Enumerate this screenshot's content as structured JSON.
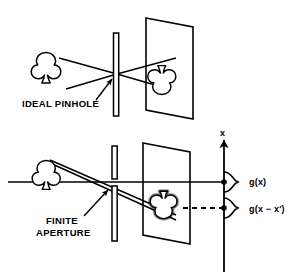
{
  "figure": {
    "title_visible": false,
    "background_color": "#ffffff",
    "ink_color": "#000000",
    "width": 300,
    "height": 279
  },
  "panels": [
    {
      "id": "ideal-pinhole",
      "caption": "IDEAL PINHOLE",
      "object_icon": "club-suit-icon",
      "barrier": "pinhole-barrier",
      "screen": "projection-screen",
      "image_icon": "club-suit-inverted-icon",
      "image_sharpness": "sharp"
    },
    {
      "id": "finite-aperture",
      "caption_line1": "FINITE",
      "caption_line2": "APERTURE",
      "object_icon": "club-suit-icon",
      "barrier": "finite-aperture-barrier",
      "screen": "projection-screen",
      "image_icon": "club-suit-blurred-icon",
      "image_sharpness": "blurred"
    }
  ],
  "plot": {
    "axis_label": "x",
    "axis_name": "x-axis-vertical",
    "curves": [
      {
        "label": "g(x)",
        "name": "psf-curve-centered",
        "position": "on-axis",
        "line_style": "solid"
      },
      {
        "label": "g(x − x′)",
        "name": "psf-curve-shifted",
        "position": "below-axis",
        "line_style": "dashed"
      }
    ]
  },
  "annotations": {
    "pinhole_pointer": "arrow-to-pinhole",
    "aperture_pointer": "arrow-to-aperture",
    "optical_axis": "horizontal-optical-axis"
  }
}
